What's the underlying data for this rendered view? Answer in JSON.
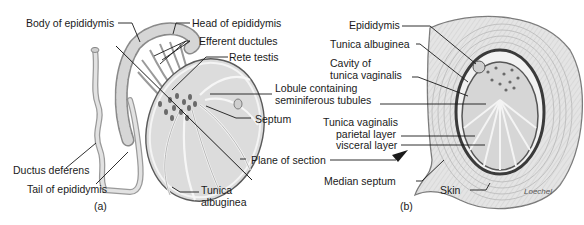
{
  "figure": {
    "panel_a": {
      "caption": "(a)",
      "labels": {
        "body_of_epididymis": "Body of epididymis",
        "head_of_epididymis": "Head of epididymis",
        "efferent_ductules": "Efferent ductules",
        "rete_testis": "Rete testis",
        "lobule_line1": "Lobule containing",
        "lobule_line2": "seminiferous tubules",
        "septum": "Septum",
        "plane_of_section": "Plane of section",
        "ductus_deferens": "Ductus deferens",
        "tail_of_epididymis": "Tail of epididymis",
        "tunica_albuginea_line1": "Tunica",
        "tunica_albuginea_line2": "albuginea"
      }
    },
    "panel_b": {
      "caption": "(b)",
      "labels": {
        "epididymis": "Epididymis",
        "tunica_albuginea": "Tunica albuginea",
        "cavity_line1": "Cavity of",
        "cavity_line2": "tunica vaginalis",
        "tunica_vaginalis": "Tunica vaginalis",
        "parietal_layer": "parietal layer",
        "visceral_layer": "visceral layer",
        "median_septum": "Median septum",
        "skin": "Skin"
      },
      "signature": "Loechel"
    },
    "colors": {
      "tissue_fill": "#d9d9d9",
      "tissue_light": "#ebebeb",
      "outline": "#6e6e6e",
      "leader_line": "#1a1a1a",
      "dark_layer": "#3a3a3a"
    }
  }
}
